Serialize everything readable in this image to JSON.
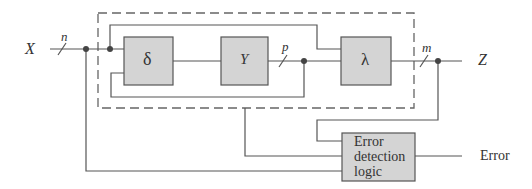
{
  "diagram": {
    "input_label": "X",
    "output_label": "Z",
    "bus_widths": {
      "input": "n",
      "middle": "p",
      "output": "m"
    },
    "blocks": [
      {
        "id": "delta",
        "label": "δ"
      },
      {
        "id": "gamma",
        "label": "Y"
      },
      {
        "id": "lambda",
        "label": "λ"
      }
    ],
    "error_block": {
      "line1": "Error",
      "line2": "detection",
      "line3": "logic"
    },
    "error_output_label": "Error",
    "colors": {
      "block_fill": "#d4d4d4",
      "line": "#555555",
      "dashed": "#666666"
    }
  }
}
